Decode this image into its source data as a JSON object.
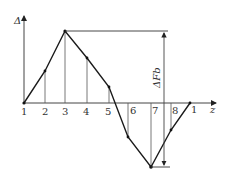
{
  "diagram": {
    "type": "piecewise-linear deformation diagram",
    "y_axis_label": "Δ",
    "x_axis_label": "z",
    "dimension_label": "ΔF_b",
    "dimension_label_display": "ΔFb",
    "point_labels": [
      "1",
      "2",
      "3",
      "4",
      "5",
      "6",
      "7",
      "8",
      "1"
    ],
    "points": [
      {
        "label": "1",
        "x": 24,
        "y": 103
      },
      {
        "label": "2",
        "x": 45,
        "y": 71
      },
      {
        "label": "3",
        "x": 65,
        "y": 31
      },
      {
        "label": "4",
        "x": 87,
        "y": 58
      },
      {
        "label": "5",
        "x": 109,
        "y": 87
      },
      {
        "label": "6",
        "x": 128,
        "y": 137
      },
      {
        "label": "7",
        "x": 151,
        "y": 167
      },
      {
        "label": "8",
        "x": 171,
        "y": 130
      },
      {
        "label": "1",
        "x": 190,
        "y": 103
      }
    ],
    "colors": {
      "line": "#1a1a1a",
      "axis": "#444444",
      "text": "#333333"
    }
  }
}
